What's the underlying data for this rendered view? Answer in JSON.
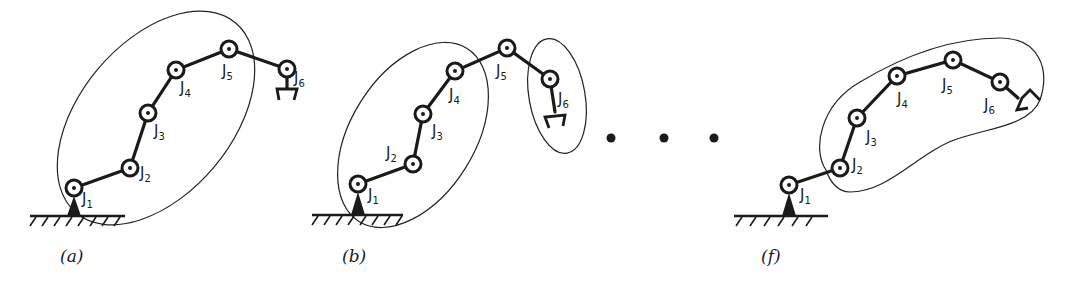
{
  "figure": {
    "panels": [
      {
        "id": "a",
        "caption": "(a)",
        "joints": [
          {
            "label": "J",
            "sub": "1",
            "x": 74,
            "y": 188,
            "lx": 82,
            "ly": 204
          },
          {
            "label": "J",
            "sub": "2",
            "x": 130,
            "y": 168,
            "lx": 140,
            "ly": 178
          },
          {
            "label": "J",
            "sub": "3",
            "x": 148,
            "y": 113,
            "lx": 154,
            "ly": 136
          },
          {
            "label": "J",
            "sub": "4",
            "x": 176,
            "y": 70,
            "lx": 180,
            "ly": 93
          },
          {
            "label": "J",
            "sub": "5",
            "x": 229,
            "y": 49,
            "lx": 222,
            "ly": 76
          },
          {
            "label": "J",
            "sub": "6",
            "x": 287,
            "y": 69,
            "lx": 294,
            "ly": 83
          }
        ]
      },
      {
        "id": "b",
        "caption": "(b)",
        "joints": [
          {
            "label": "J",
            "sub": "1",
            "x": 358,
            "y": 184,
            "lx": 368,
            "ly": 200
          },
          {
            "label": "J",
            "sub": "2",
            "x": 413,
            "y": 164,
            "lx": 386,
            "ly": 158
          },
          {
            "label": "J",
            "sub": "3",
            "x": 423,
            "y": 114,
            "lx": 432,
            "ly": 136
          },
          {
            "label": "J",
            "sub": "4",
            "x": 455,
            "y": 71,
            "lx": 449,
            "ly": 100
          },
          {
            "label": "J",
            "sub": "5",
            "x": 507,
            "y": 48,
            "lx": 496,
            "ly": 76
          },
          {
            "label": "J",
            "sub": "6",
            "x": 550,
            "y": 79,
            "lx": 558,
            "ly": 104
          }
        ]
      },
      {
        "id": "f",
        "caption": "(f)",
        "joints": [
          {
            "label": "J",
            "sub": "1",
            "x": 789,
            "y": 185,
            "lx": 800,
            "ly": 200
          },
          {
            "label": "J",
            "sub": "2",
            "x": 840,
            "y": 168,
            "lx": 852,
            "ly": 170
          },
          {
            "label": "J",
            "sub": "3",
            "x": 857,
            "y": 118,
            "lx": 866,
            "ly": 142
          },
          {
            "label": "J",
            "sub": "4",
            "x": 897,
            "y": 76,
            "lx": 897,
            "ly": 104
          },
          {
            "label": "J",
            "sub": "5",
            "x": 953,
            "y": 60,
            "lx": 942,
            "ly": 90
          },
          {
            "label": "J",
            "sub": "6",
            "x": 1000,
            "y": 82,
            "lx": 984,
            "ly": 110
          }
        ]
      }
    ],
    "ellipsis": "• • •",
    "colors": {
      "ink": "#1a1a1a",
      "background": "#ffffff"
    }
  }
}
